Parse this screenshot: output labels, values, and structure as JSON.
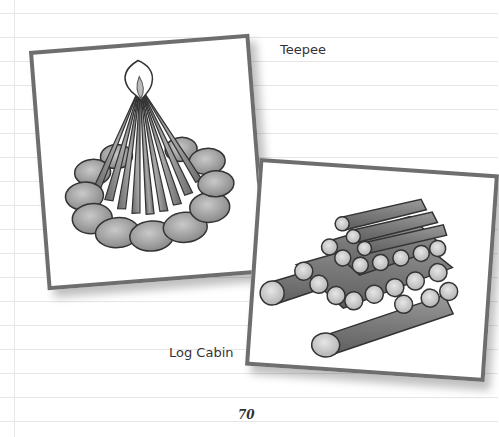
{
  "page": {
    "captions": {
      "teepee": "Teepee",
      "log_cabin": "Log Cabin"
    },
    "page_number": "70",
    "illustrations": [
      {
        "name": "teepee-fire-illustration",
        "description": "Campfire with sticks arranged in a cone inside a ring of stones"
      },
      {
        "name": "log-cabin-fire-illustration",
        "description": "Logs stacked in a crisscross square layered structure"
      }
    ],
    "colors": {
      "frame": "#6e6e6e",
      "rule_line": "#e6e6e6",
      "text": "#333333"
    }
  }
}
